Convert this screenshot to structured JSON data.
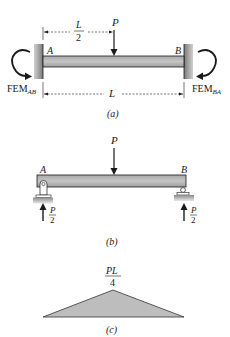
{
  "figure_a": {
    "caption": "(a)",
    "load_label": "P",
    "half_span_num": "L",
    "half_span_den": "2",
    "span_label": "L",
    "left_end": "A",
    "right_end": "B",
    "fem_left_main": "FEM",
    "fem_left_sub": "AB",
    "fem_right_main": "FEM",
    "fem_right_sub": "BA"
  },
  "figure_b": {
    "caption": "(b)",
    "load_label": "P",
    "left_end": "A",
    "right_end": "B",
    "reaction_left_num": "P",
    "reaction_left_den": "2",
    "reaction_right_num": "P",
    "reaction_right_den": "2"
  },
  "figure_c": {
    "caption": "(c)",
    "peak_num": "PL",
    "peak_den": "4"
  },
  "colors": {
    "beam_fill": "#b8b8b8",
    "wall_fill": "#8c8c8c",
    "diagram_fill": "#bdbdbd",
    "stroke": "#1a1a1a"
  }
}
